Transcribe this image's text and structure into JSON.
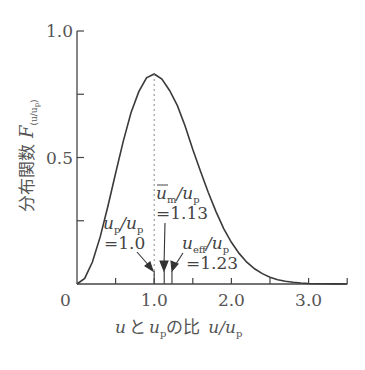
{
  "chart_data": {
    "type": "line",
    "title": "",
    "xlabel": "u と u_p の比 u/u_p",
    "ylabel": "分布関数 F(u/u_p)",
    "xlim": [
      0,
      3.5
    ],
    "ylim": [
      0,
      1.0
    ],
    "grid": false,
    "legend": null,
    "x_ticks": [
      0,
      0.5,
      1.0,
      1.5,
      2.0,
      2.5,
      3.0,
      3.5
    ],
    "x_tick_labels": [
      {
        "x": 0,
        "label": "0"
      },
      {
        "x": 1.0,
        "label": "1.0"
      },
      {
        "x": 2.0,
        "label": "2.0"
      },
      {
        "x": 3.0,
        "label": "3.0"
      }
    ],
    "y_ticks": [
      0,
      0.25,
      0.5,
      0.75,
      1.0
    ],
    "y_tick_labels": [
      {
        "y": 0.5,
        "label": "0.5"
      },
      {
        "y": 1.0,
        "label": "1.0"
      }
    ],
    "series": [
      {
        "name": "F(u/u_p) Maxwell distribution",
        "x": [
          0,
          0.1,
          0.2,
          0.3,
          0.4,
          0.5,
          0.6,
          0.7,
          0.8,
          0.9,
          1.0,
          1.1,
          1.2,
          1.3,
          1.4,
          1.5,
          1.6,
          1.7,
          1.8,
          1.9,
          2.0,
          2.1,
          2.2,
          2.3,
          2.4,
          2.5,
          2.6,
          2.7,
          2.8,
          2.9,
          3.0,
          3.1,
          3.2,
          3.3,
          3.4,
          3.5
        ],
        "values": [
          0.0,
          0.022,
          0.087,
          0.186,
          0.307,
          0.438,
          0.565,
          0.677,
          0.76,
          0.815,
          0.83,
          0.81,
          0.765,
          0.705,
          0.625,
          0.532,
          0.446,
          0.363,
          0.286,
          0.219,
          0.165,
          0.121,
          0.086,
          0.06,
          0.041,
          0.027,
          0.017,
          0.011,
          0.007,
          0.004,
          0.002,
          0.001,
          0.0006,
          0.0003,
          0.0002,
          0.0001
        ]
      }
    ],
    "annotations": [
      {
        "id": "peak",
        "x": 1.0,
        "text_main": "u",
        "text_sub": "p",
        "text_rest": "/u",
        "text_sub2": "p",
        "value_label": "=1.0"
      },
      {
        "id": "mean",
        "x": 1.13,
        "text_main": "u",
        "overline": true,
        "text_sub": "m",
        "text_rest": "/u",
        "text_sub2": "p",
        "value_label": "=1.13"
      },
      {
        "id": "eff",
        "x": 1.23,
        "text_main": "u",
        "text_sub": "eff",
        "text_rest": "/u",
        "text_sub2": "p",
        "value_label": "=1.23"
      }
    ],
    "peak_dashed_line": {
      "x": 1.0,
      "y": 0.83
    }
  },
  "labels": {
    "y_axis_jp": "分布関数",
    "y_axis_sym": "F",
    "y_axis_sub": "(u/u",
    "y_axis_sub_p": "p",
    "y_axis_sub_close": ")",
    "x_axis_u": "u",
    "x_axis_to": "と",
    "x_axis_up": "u",
    "x_axis_p": "p",
    "x_axis_no_hi": "の比",
    "x_axis_ratio": "u/u",
    "x_axis_ratio_p": "p"
  },
  "colors": {
    "line": "#3a3a3a",
    "axis": "#444444",
    "text": "#555555",
    "dashed": "#888888"
  }
}
